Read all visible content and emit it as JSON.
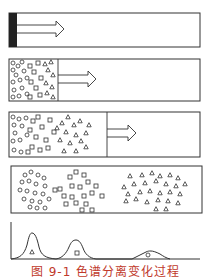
{
  "figure": {
    "caption": "图 9-1  色谱分离变化过程",
    "caption_color": "#c0392b",
    "line_color": "#333333",
    "panels": [
      {
        "stage": 1,
        "description": "sample loaded as dark band at column inlet",
        "arrow": "flow-direction"
      },
      {
        "stage": 2,
        "description": "mixed band of circles, squares, triangles beginning to spread",
        "arrow": "flow-direction"
      },
      {
        "stage": 3,
        "description": "components partially separating along column",
        "arrow": "flow-direction"
      },
      {
        "stage": 4,
        "description": "three separated zones: circles, squares, triangles"
      }
    ],
    "chromatogram": {
      "peaks": [
        {
          "symbol": "triangle",
          "position": "first",
          "height": "tallest"
        },
        {
          "symbol": "square",
          "position": "second",
          "height": "medium"
        },
        {
          "symbol": "circle",
          "position": "third",
          "height": "lowest, broadest"
        }
      ]
    }
  }
}
